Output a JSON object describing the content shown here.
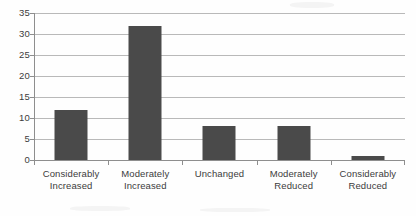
{
  "chart_data": {
    "type": "bar",
    "title": "",
    "subtitle": "",
    "xlabel": "",
    "ylabel": "",
    "categories": [
      "Considerably Increased",
      "Moderately Increased",
      "Unchanged",
      "Moderately Reduced",
      "Considerably Reduced"
    ],
    "category_lines": [
      [
        "Considerably",
        "Increased"
      ],
      [
        "Moderately",
        "Increased"
      ],
      [
        "Unchanged",
        ""
      ],
      [
        "Moderately",
        "Reduced"
      ],
      [
        "Considerably",
        "Reduced"
      ]
    ],
    "values": [
      12,
      32,
      8,
      8,
      1
    ],
    "ylim": [
      0,
      35
    ],
    "yticks": [
      0,
      5,
      10,
      15,
      20,
      25,
      30,
      35
    ],
    "ytick_labels": [
      "0",
      "5",
      "10",
      "15",
      "20",
      "25",
      "30",
      "35"
    ],
    "grid": "horizontal",
    "legend": "none",
    "bar_color": "#4a4a4a",
    "gridline_color": "#b9b9b9",
    "axis_color": "#8e8e8e",
    "background_color": "#fefefe",
    "text_color": "#3c3c3c"
  }
}
